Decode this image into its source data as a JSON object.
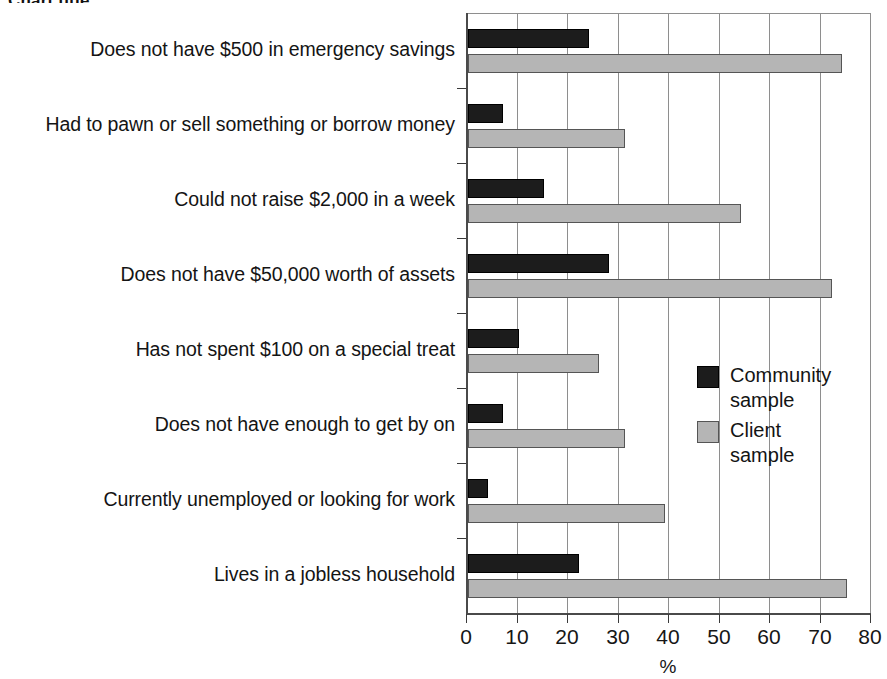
{
  "title": "Chart title",
  "legend": {
    "position": "inside-right",
    "entries": [
      {
        "label": "Community\nsample",
        "color": "#1c1c1c",
        "swatch": "black-square-swatch"
      },
      {
        "label": "Client sample",
        "color": "#b5b5b5",
        "swatch": "gray-square-swatch"
      }
    ]
  },
  "axis": {
    "x_title": "%",
    "ticks": [
      "0",
      "10",
      "20",
      "30",
      "40",
      "50",
      "60",
      "70",
      "80"
    ]
  },
  "chart_data": {
    "type": "bar",
    "orientation": "horizontal",
    "title": "",
    "xlabel": "%",
    "ylabel": "",
    "xlim": [
      0,
      80
    ],
    "xticks": [
      0,
      10,
      20,
      30,
      40,
      50,
      60,
      70,
      80
    ],
    "grid": "vertical",
    "legend_position": "inside-right",
    "categories": [
      "Does not have $500 in emergency savings",
      "Had to pawn or sell something or borrow money",
      "Could not raise $2,000 in a week",
      "Does not have $50,000 worth of assets",
      "Has not spent $100 on a special treat",
      "Does not have enough to get by on",
      "Currently unemployed or looking for work",
      "Lives in a jobless household"
    ],
    "series": [
      {
        "name": "Community sample",
        "color": "#1c1c1c",
        "values": [
          24,
          7,
          15,
          28,
          10,
          7,
          4,
          22
        ]
      },
      {
        "name": "Client sample",
        "color": "#b5b5b5",
        "values": [
          74,
          31,
          54,
          72,
          26,
          31,
          39,
          75
        ]
      }
    ]
  }
}
